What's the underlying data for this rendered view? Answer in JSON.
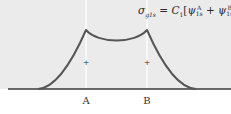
{
  "diagram": {
    "title_formula": {
      "lhs_symbol": "σ",
      "lhs_subscript": "g1s",
      "equals": "=",
      "coefficient": "C",
      "coefficient_subscript": "1",
      "open_bracket": "[",
      "psi": "ψ",
      "term1_sup": "A",
      "term1_sub": "1s",
      "plus": "+",
      "term2_sup": "B",
      "term2_sub": "1s",
      "close_bracket": "]"
    },
    "nuclei": [
      {
        "label": "A",
        "x": 86
      },
      {
        "label": "B",
        "x": 147
      }
    ],
    "nucleus_marker": "+",
    "colors": {
      "panel_background": "#ebebeb",
      "curve": "#555555",
      "axis": "#3a3a3a",
      "guide_lines": "#ffffff"
    }
  }
}
